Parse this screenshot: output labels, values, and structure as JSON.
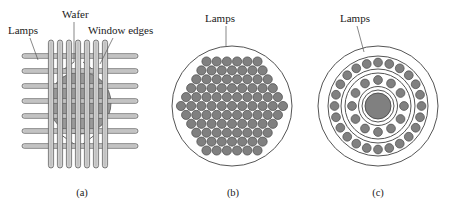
{
  "figure": {
    "background_color": "#ffffff",
    "ink_color": "#1a1a1a",
    "lamp_fill": "#808080",
    "lamp_stroke": "#4a4a4a",
    "wafer_fill": "#9a9a9a",
    "tube_fill": "#cfcfcf",
    "tube_stroke": "#555555",
    "outline_stroke": "#555555"
  },
  "panels": [
    {
      "id": "a",
      "caption": "(a)",
      "caption_x": 82,
      "caption_y": 196,
      "type": "crossed-linear-lamps",
      "labels": [
        {
          "text": "Lamps",
          "x": 8,
          "y": 34,
          "anchor": "start",
          "leader": [
            [
              30,
              38
            ],
            [
              38,
              60
            ]
          ]
        },
        {
          "text": "Wafer",
          "x": 62,
          "y": 18,
          "anchor": "start",
          "leader": [
            [
              74,
              22
            ],
            [
              74,
              62
            ]
          ]
        },
        {
          "text": "Window edges",
          "x": 88,
          "y": 34,
          "anchor": "start",
          "leader": [
            [
              113,
              38
            ],
            [
              100,
              64
            ]
          ]
        }
      ],
      "wafer": {
        "cx": 80,
        "cy": 103,
        "r": 31
      },
      "vertical_lamps": {
        "count": 7,
        "x_positions": [
          51,
          60,
          69,
          78,
          87,
          96,
          105
        ],
        "y_top": 40,
        "y_bottom": 168,
        "width": 5.2
      },
      "horizontal_lamps": {
        "count": 7,
        "y_positions": [
          56,
          71,
          86,
          101,
          116,
          131,
          146
        ],
        "x_left": 22,
        "x_right": 138,
        "height": 4.6
      },
      "window_edges": [
        [
          [
            60,
            72
          ],
          [
            74,
            62
          ]
        ],
        [
          [
            96,
            72
          ],
          [
            83,
            62
          ]
        ],
        [
          [
            60,
            134
          ],
          [
            74,
            144
          ]
        ],
        [
          [
            96,
            134
          ],
          [
            83,
            144
          ]
        ]
      ]
    },
    {
      "id": "b",
      "caption": "(b)",
      "caption_x": 233,
      "caption_y": 196,
      "type": "hex-packed-lamp-array",
      "labels": [
        {
          "text": "Lamps",
          "x": 205,
          "y": 22,
          "anchor": "start",
          "leader": [
            [
              226,
              26
            ],
            [
              226,
              46
            ]
          ]
        }
      ],
      "boundary": {
        "cx": 232,
        "cy": 106,
        "r": 60
      },
      "lamp_radius": 4.6,
      "lamp_spacing_x": 10.2,
      "lamp_spacing_y": 8.9,
      "lamp_count": 97,
      "rows": 12
    },
    {
      "id": "c",
      "caption": "(c)",
      "caption_x": 378,
      "caption_y": 196,
      "type": "concentric-ring-lamps",
      "labels": [
        {
          "text": "Lamps",
          "x": 340,
          "y": 22,
          "anchor": "start",
          "leader": [
            [
              357,
              26
            ],
            [
              364,
              52
            ]
          ]
        }
      ],
      "center": {
        "cx": 378,
        "cy": 106
      },
      "rings": [
        {
          "name": "outer-boundary",
          "r": 60,
          "type": "outline"
        },
        {
          "name": "outer-lamp-track-outer",
          "r": 50,
          "type": "outline"
        },
        {
          "name": "outer-lamp-ring",
          "r": 43.5,
          "type": "lamps",
          "count": 24,
          "lamp_radius": 4.4,
          "start_angle": -90
        },
        {
          "name": "outer-lamp-track-inner",
          "r": 37,
          "type": "outline"
        },
        {
          "name": "mid-lamp-track-outer",
          "r": 33,
          "type": "outline"
        },
        {
          "name": "mid-lamp-ring",
          "r": 26,
          "type": "lamps",
          "count": 12,
          "lamp_radius": 4.4,
          "start_angle": -90
        },
        {
          "name": "mid-lamp-track-inner",
          "r": 19.5,
          "type": "outline"
        },
        {
          "name": "center-disc-outline",
          "r": 16,
          "type": "outline"
        },
        {
          "name": "center-disc",
          "r": 13,
          "type": "disc"
        }
      ]
    }
  ]
}
